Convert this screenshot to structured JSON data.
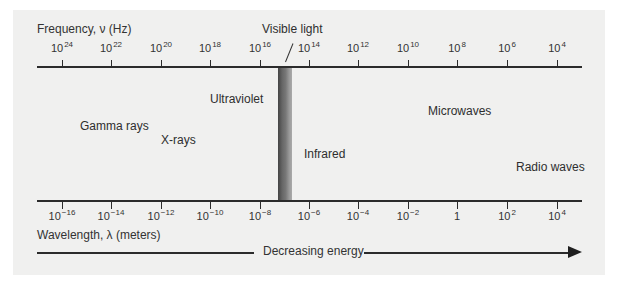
{
  "diagram": {
    "frequency_axis": {
      "title": "Frequency, ν (Hz)",
      "ticks": [
        {
          "base": "10",
          "exp": "24"
        },
        {
          "base": "10",
          "exp": "22"
        },
        {
          "base": "10",
          "exp": "20"
        },
        {
          "base": "10",
          "exp": "18"
        },
        {
          "base": "10",
          "exp": "16"
        },
        {
          "base": "10",
          "exp": "14"
        },
        {
          "base": "10",
          "exp": "12"
        },
        {
          "base": "10",
          "exp": "10"
        },
        {
          "base": "10",
          "exp": "8"
        },
        {
          "base": "10",
          "exp": "6"
        },
        {
          "base": "10",
          "exp": "4"
        }
      ]
    },
    "wavelength_axis": {
      "title": "Wavelength, λ (meters)",
      "ticks": [
        {
          "base": "10",
          "exp": "−16"
        },
        {
          "base": "10",
          "exp": "−14"
        },
        {
          "base": "10",
          "exp": "−12"
        },
        {
          "base": "10",
          "exp": "−10"
        },
        {
          "base": "10",
          "exp": "−8"
        },
        {
          "base": "10",
          "exp": "−6"
        },
        {
          "base": "10",
          "exp": "−4"
        },
        {
          "base": "10",
          "exp": "−2"
        },
        {
          "base": "1",
          "exp": ""
        },
        {
          "base": "10",
          "exp": "2"
        },
        {
          "base": "10",
          "exp": "4"
        }
      ]
    },
    "regions": {
      "gamma": "Gamma rays",
      "xray": "X-rays",
      "ultraviolet": "Ultraviolet",
      "visible": "Visible light",
      "infrared": "Infrared",
      "microwaves": "Microwaves",
      "radio": "Radio waves"
    },
    "energy_arrow": {
      "label": "Decreasing energy"
    },
    "colors": {
      "panel_background": "#f0f0ef",
      "axis": "#2b2b2b",
      "visible_band_dark": "#444444",
      "visible_band_light": "#aaaaaa"
    }
  }
}
